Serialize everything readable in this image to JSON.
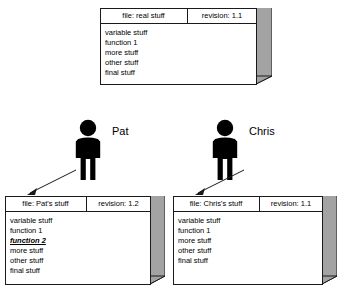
{
  "diagram": {
    "background_color": "#ffffff",
    "line_color": "#1a1a1a",
    "face_color": "#a3a3a3",
    "front_face_color": "#ffffff"
  },
  "boxes": [
    {
      "id": "repository",
      "name": "repository-file-box",
      "header": {
        "file_label": "file: real stuff",
        "revision_label": "revision: 1.1"
      },
      "lines": [
        {
          "text": "variable stuff",
          "modified": false
        },
        {
          "text": "function 1",
          "modified": false
        },
        {
          "text": "more stuff",
          "modified": false
        },
        {
          "text": "other stuff",
          "modified": false
        },
        {
          "text": "final stuff",
          "modified": false
        }
      ]
    },
    {
      "id": "pat",
      "name": "pat-file-box",
      "header": {
        "file_label": "file: Pat's stuff",
        "revision_label": "revision: 1.2"
      },
      "lines": [
        {
          "text": "variable stuff",
          "modified": false
        },
        {
          "text": "function 1",
          "modified": false
        },
        {
          "text": "function 2",
          "modified": true
        },
        {
          "text": "more stuff",
          "modified": false
        },
        {
          "text": "other stuff",
          "modified": false
        },
        {
          "text": "final stuff",
          "modified": false
        }
      ]
    },
    {
      "id": "chris",
      "name": "chris-file-box",
      "header": {
        "file_label": "file: Chris's stuff",
        "revision_label": "revision: 1.1"
      },
      "lines": [
        {
          "text": "variable stuff",
          "modified": false
        },
        {
          "text": "function 1",
          "modified": false
        },
        {
          "text": "more stuff",
          "modified": false
        },
        {
          "text": "other stuff",
          "modified": false
        },
        {
          "text": "final stuff",
          "modified": false
        }
      ]
    }
  ],
  "people": [
    {
      "id": "pat",
      "name": "pat-person",
      "label": "Pat",
      "icon": "person-icon"
    },
    {
      "id": "chris",
      "name": "chris-person",
      "label": "Chris",
      "icon": "person-icon"
    }
  ],
  "connectors": [
    {
      "id": "pat-to-box",
      "name": "pat-checkout-arrow",
      "icon": "arrow-icon"
    },
    {
      "id": "chris-to-box",
      "name": "chris-checkout-arrow",
      "icon": "arrow-icon"
    }
  ]
}
